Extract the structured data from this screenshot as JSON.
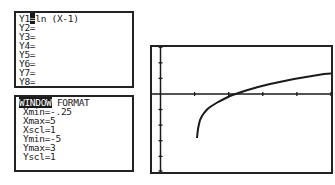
{
  "y_editor": {
    "lines": [
      "Y1=ln (X-1)",
      "Y2=",
      "Y3=",
      "Y4=",
      "Y5=",
      "Y6=",
      "Y7=",
      "Y8="
    ],
    "y1_prefix": "Y1",
    "y1_expr": "ln (X-1)"
  },
  "window_editor": {
    "tab_window": "WINDOW",
    "tab_format": "FORMAT",
    "settings": [
      "Xmin=-.25",
      "Xmax=5",
      "Xscl=1",
      "Ymin=-5",
      "Ymax=3",
      "Yscl=1"
    ]
  },
  "graph": {
    "function": "ln(X-1)",
    "xmin": -0.25,
    "xmax": 5,
    "xscl": 1,
    "ymin": -5,
    "ymax": 3,
    "yscl": 1
  }
}
